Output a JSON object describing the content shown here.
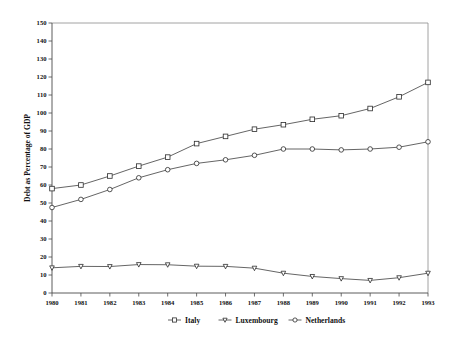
{
  "chart_data": {
    "type": "line",
    "title": "",
    "xlabel": "",
    "ylabel": "Debt as Percentage of GDP",
    "x": [
      1980,
      1981,
      1982,
      1983,
      1984,
      1985,
      1986,
      1987,
      1988,
      1989,
      1990,
      1991,
      1992,
      1993
    ],
    "xtick_labels": [
      "1980",
      "1981",
      "1982",
      "1983",
      "1984",
      "1985",
      "1986",
      "1987",
      "1988",
      "1989",
      "1990",
      "1991",
      "1992",
      "1993"
    ],
    "ytick_labels": [
      "0",
      "10",
      "20",
      "30",
      "40",
      "50",
      "60",
      "70",
      "80",
      "90",
      "100",
      "110",
      "120",
      "130",
      "140",
      "150"
    ],
    "yticks": [
      0,
      10,
      20,
      30,
      40,
      50,
      60,
      70,
      80,
      90,
      100,
      110,
      120,
      130,
      140,
      150
    ],
    "ylim": [
      0,
      150
    ],
    "xlim": [
      1980,
      1993
    ],
    "grid": false,
    "legend_position": "bottom",
    "series": [
      {
        "name": "Italy",
        "marker": "square",
        "color": "#2b2b2b",
        "values": [
          58,
          60,
          65,
          70.5,
          75.5,
          83,
          87,
          91,
          93.5,
          96.5,
          98.5,
          102.5,
          109,
          117
        ]
      },
      {
        "name": "Luxembourg",
        "marker": "triangle-down",
        "color": "#2b2b2b",
        "values": [
          14,
          14.8,
          14.7,
          15.8,
          15.7,
          14.9,
          14.8,
          13.8,
          11,
          9.2,
          8,
          7,
          8.5,
          11
        ]
      },
      {
        "name": "Netherlands",
        "marker": "circle",
        "color": "#2b2b2b",
        "values": [
          47.5,
          52,
          57.5,
          64,
          68.5,
          72,
          74,
          76.5,
          80,
          80,
          79.5,
          80,
          81,
          84
        ]
      }
    ]
  },
  "legend": {
    "entries": [
      {
        "label": "Italy",
        "marker": "square"
      },
      {
        "label": "Luxembourg",
        "marker": "triangle-down"
      },
      {
        "label": "Netherlands",
        "marker": "circle"
      }
    ]
  },
  "axes": {
    "y_axis_title": "Debt as Percentage of GDP"
  }
}
